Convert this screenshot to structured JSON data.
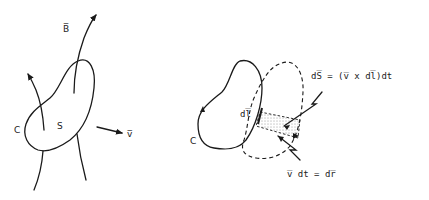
{
  "figure": {
    "left_panel": {
      "labels": {
        "field": "B̅",
        "curve": "C",
        "surface": "S",
        "velocity": "v̅"
      }
    },
    "right_panel": {
      "labels": {
        "curve": "C",
        "line_element": "dl̅",
        "surface_element_eq": "dS̅ = (v̅ x dl̅)dt",
        "displacement_eq": "v̅ dt = dr̅"
      }
    },
    "colors": {
      "ink": "#1a1a1a",
      "background": "#ffffff"
    }
  }
}
